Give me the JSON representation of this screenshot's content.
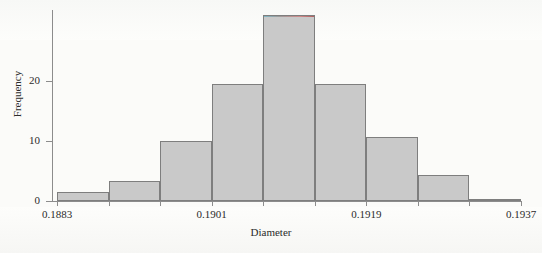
{
  "figure": {
    "background_color": "#fbfbf9",
    "axis_color": "#8c8c8c",
    "bar_fill_color": "#c9c9c9",
    "bar_edge_color": "#7e7e7e"
  },
  "chart_data": {
    "type": "bar",
    "title": "",
    "subtitle": "",
    "xlabel": "Diameter",
    "ylabel": "Frequency",
    "grid": false,
    "legend": null,
    "ylim": [
      0,
      31.8
    ],
    "xlim": [
      0.1883,
      0.1937
    ],
    "yticks": [
      0,
      10,
      20
    ],
    "ytick_labels": [
      "0",
      "10",
      "20"
    ],
    "xticks": [
      0.1883,
      0.1901,
      0.1919,
      0.1937
    ],
    "xtick_labels": [
      "0.1883",
      "0.1901",
      "0.1919",
      "0.1937"
    ],
    "bin_width": 0.0006,
    "bin_edges": [
      0.1883,
      0.1889,
      0.1895,
      0.1901,
      0.1907,
      0.1913,
      0.1919,
      0.1925,
      0.1931,
      0.1937
    ],
    "categories": [
      "0.1883-0.1889",
      "0.1889-0.1895",
      "0.1895-0.1901",
      "0.1901-0.1907",
      "0.1907-0.1913",
      "0.1913-0.1919",
      "0.1919-0.1925",
      "0.1925-0.1931",
      "0.1931-0.1937"
    ],
    "values": [
      1.5,
      3.3,
      10,
      19.5,
      31,
      19.5,
      10.7,
      4.3,
      0.4
    ]
  }
}
